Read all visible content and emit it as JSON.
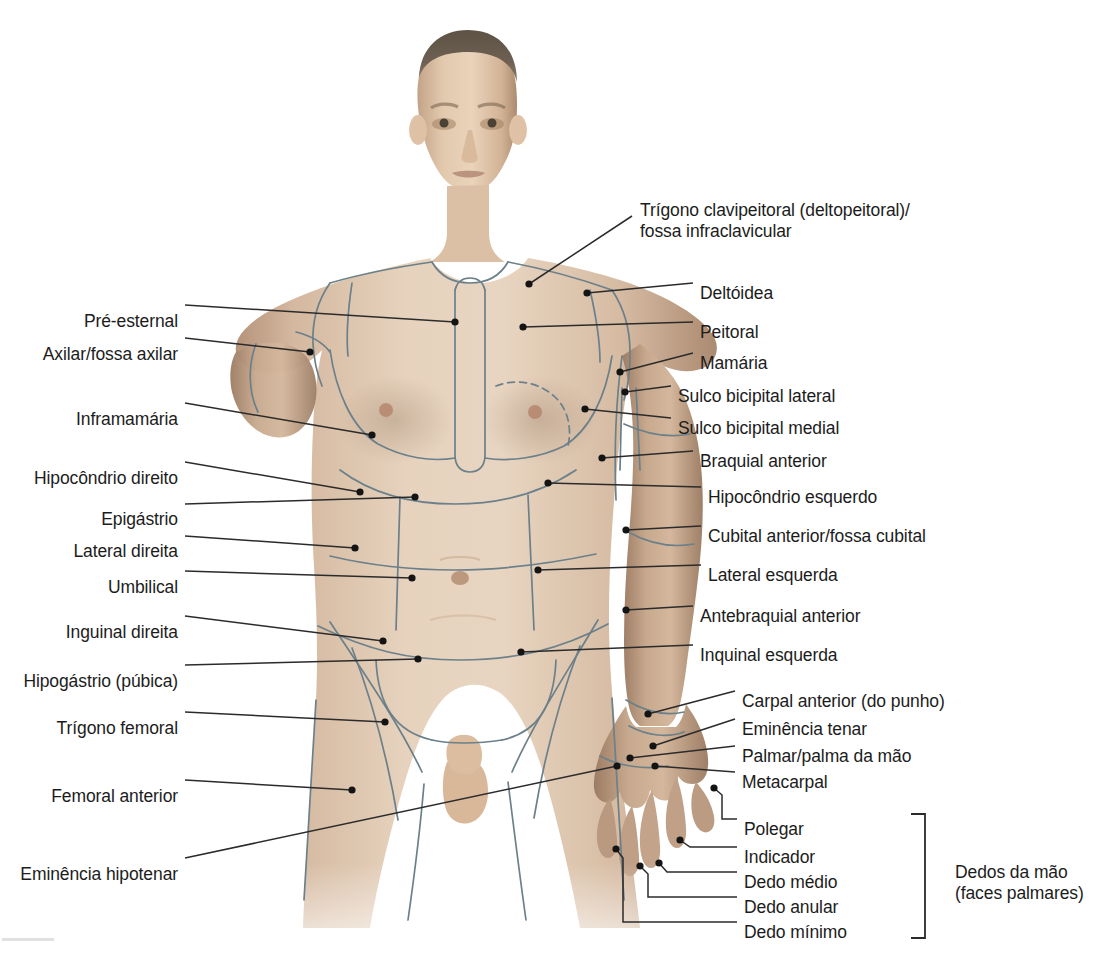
{
  "figure": {
    "width": 1109,
    "height": 958
  },
  "colors": {
    "region_line": "#6b808a",
    "leader_line": "#2b2b2b",
    "text": "#1c1c1c",
    "background": "#ffffff",
    "skin_light": "#e3cdb6",
    "skin_mid": "#cdb096",
    "skin_shadow": "#a88a6f"
  },
  "labels_left": [
    {
      "id": "pre-esternal",
      "text": "Pré-esternal",
      "x": 178,
      "y": 311
    },
    {
      "id": "axilar",
      "text": "Axilar/fossa axilar",
      "x": 178,
      "y": 344
    },
    {
      "id": "inframamaria",
      "text": "Inframamária",
      "x": 178,
      "y": 409
    },
    {
      "id": "hipocondrio-direito",
      "text": "Hipocôndrio direito",
      "x": 178,
      "y": 468
    },
    {
      "id": "epigastrio",
      "text": "Epigástrio",
      "x": 178,
      "y": 509
    },
    {
      "id": "lateral-direita",
      "text": "Lateral direita",
      "x": 178,
      "y": 541
    },
    {
      "id": "umbilical",
      "text": "Umbilical",
      "x": 178,
      "y": 577
    },
    {
      "id": "inguinal-direita",
      "text": "Inguinal direita",
      "x": 178,
      "y": 622
    },
    {
      "id": "hipogastrio",
      "text": "Hipogástrio (púbica)",
      "x": 178,
      "y": 671
    },
    {
      "id": "trigono-femoral",
      "text": "Trígono femoral",
      "x": 178,
      "y": 718
    },
    {
      "id": "femoral-anterior",
      "text": "Femoral anterior",
      "x": 178,
      "y": 786
    },
    {
      "id": "eminencia-hipotenar",
      "text": "Eminência hipotenar",
      "x": 178,
      "y": 864
    }
  ],
  "labels_right": [
    {
      "id": "trigono-clavipeitoral",
      "text": "Trígono clavipeitoral (deltopeitoral)/\nfossa infraclavicular",
      "x": 640,
      "y": 200,
      "multiline": true
    },
    {
      "id": "deltoidea",
      "text": "Deltóidea",
      "x": 700,
      "y": 283
    },
    {
      "id": "peitoral",
      "text": "Peitoral",
      "x": 700,
      "y": 322
    },
    {
      "id": "mamaria",
      "text": "Mamária",
      "x": 700,
      "y": 353
    },
    {
      "id": "sulco-bicipital-lateral",
      "text": "Sulco bicipital lateral",
      "x": 678,
      "y": 386
    },
    {
      "id": "sulco-bicipital-medial",
      "text": "Sulco bicipital medial",
      "x": 678,
      "y": 418
    },
    {
      "id": "braquial-anterior",
      "text": "Braquial anterior",
      "x": 700,
      "y": 451
    },
    {
      "id": "hipocondrio-esquerdo",
      "text": "Hipocôndrio esquerdo",
      "x": 708,
      "y": 487
    },
    {
      "id": "cubital-anterior",
      "text": "Cubital anterior/fossa cubital",
      "x": 708,
      "y": 526
    },
    {
      "id": "lateral-esquerda",
      "text": "Lateral esquerda",
      "x": 708,
      "y": 565
    },
    {
      "id": "antebraquial-anterior",
      "text": "Antebraquial anterior",
      "x": 700,
      "y": 606
    },
    {
      "id": "inquinal-esquerda",
      "text": "Inquinal esquerda",
      "x": 700,
      "y": 645
    },
    {
      "id": "carpal-anterior",
      "text": "Carpal anterior (do punho)",
      "x": 742,
      "y": 691
    },
    {
      "id": "eminencia-tenar",
      "text": "Eminência tenar",
      "x": 742,
      "y": 719
    },
    {
      "id": "palmar",
      "text": "Palmar/palma da mão",
      "x": 742,
      "y": 746
    },
    {
      "id": "metacarpal",
      "text": "Metacarpal",
      "x": 742,
      "y": 772
    }
  ],
  "labels_fingers": [
    {
      "id": "polegar",
      "text": "Polegar",
      "x": 744,
      "y": 819
    },
    {
      "id": "indicador",
      "text": "Indicador",
      "x": 744,
      "y": 847
    },
    {
      "id": "dedo-medio",
      "text": "Dedo médio",
      "x": 744,
      "y": 872
    },
    {
      "id": "dedo-anular",
      "text": "Dedo anular",
      "x": 744,
      "y": 897
    },
    {
      "id": "dedo-minimo",
      "text": "Dedo mínimo",
      "x": 744,
      "y": 922
    }
  ],
  "bracket_group": {
    "id": "dedos-da-mao",
    "text": "Dedos da mão\n(faces palmares)",
    "x": 955,
    "y": 862,
    "bracket": {
      "x": 925,
      "top": 814,
      "bottom": 938,
      "tick": 14
    }
  },
  "leader_lines_left": [
    {
      "id": "pre-esternal",
      "points": "185,305 455,322",
      "dot": [
        455,
        322
      ]
    },
    {
      "id": "axilar",
      "points": "185,338 310,352",
      "dot": [
        310,
        352
      ]
    },
    {
      "id": "inframamaria",
      "points": "185,403 372,435",
      "dot": [
        372,
        435
      ]
    },
    {
      "id": "hipocondrio-direito",
      "points": "185,462 360,492",
      "dot": [
        360,
        492
      ]
    },
    {
      "id": "epigastrio",
      "points": "185,504 415,497",
      "dot": [
        415,
        497
      ]
    },
    {
      "id": "lateral-direita",
      "points": "185,536 355,548",
      "dot": [
        355,
        548
      ]
    },
    {
      "id": "umbilical",
      "points": "185,571 412,578",
      "dot": [
        412,
        578
      ]
    },
    {
      "id": "inguinal-direita",
      "points": "185,616 383,641",
      "dot": [
        383,
        641
      ]
    },
    {
      "id": "hipogastrio",
      "points": "185,665 418,659",
      "dot": [
        418,
        659
      ]
    },
    {
      "id": "trigono-femoral",
      "points": "185,712 385,722",
      "dot": [
        385,
        722
      ]
    },
    {
      "id": "femoral-anterior",
      "points": "185,780 352,790",
      "dot": [
        352,
        790
      ]
    },
    {
      "id": "eminencia-hipotenar",
      "points": "185,858 617,766",
      "dot": [
        617,
        766
      ]
    }
  ],
  "leader_lines_right": [
    {
      "id": "trigono-clavipeitoral",
      "points": "632,216 529,284",
      "dot": [
        529,
        284
      ]
    },
    {
      "id": "deltoidea",
      "points": "693,283 587,293",
      "dot": [
        587,
        293
      ]
    },
    {
      "id": "peitoral",
      "points": "693,322 523,327",
      "dot": [
        523,
        327
      ]
    },
    {
      "id": "mamaria",
      "points": "693,353 620,372",
      "dot": [
        620,
        372
      ]
    },
    {
      "id": "sulco-bicipital-lateral",
      "points": "671,386 625,392",
      "dot": [
        625,
        392
      ]
    },
    {
      "id": "sulco-bicipital-medial",
      "points": "671,418 585,409",
      "dot": [
        585,
        409
      ]
    },
    {
      "id": "braquial-anterior",
      "points": "693,451 602,458",
      "dot": [
        602,
        458
      ]
    },
    {
      "id": "hipocondrio-esquerdo",
      "points": "701,487 548,483",
      "dot": [
        548,
        483
      ]
    },
    {
      "id": "cubital-anterior",
      "points": "701,526 626,530",
      "dot": [
        626,
        530
      ]
    },
    {
      "id": "lateral-esquerda",
      "points": "701,565 538,570",
      "dot": [
        538,
        570
      ]
    },
    {
      "id": "antebraquial-anterior",
      "points": "693,606 626,610",
      "dot": [
        626,
        610
      ]
    },
    {
      "id": "inquinal-esquerda",
      "points": "693,645 521,652",
      "dot": [
        521,
        652
      ]
    },
    {
      "id": "carpal-anterior",
      "points": "735,691 648,714",
      "dot": [
        648,
        714
      ]
    },
    {
      "id": "eminencia-tenar",
      "points": "735,719 653,746",
      "dot": [
        653,
        746
      ]
    },
    {
      "id": "palmar",
      "points": "735,746 630,758",
      "dot": [
        630,
        758
      ]
    },
    {
      "id": "metacarpal",
      "points": "735,772 655,766",
      "dot": [
        655,
        766
      ]
    }
  ],
  "leader_lines_fingers": [
    {
      "id": "polegar",
      "points": "737,819 722,819 722,795 714,788",
      "dot": [
        714,
        788
      ]
    },
    {
      "id": "indicador",
      "points": "737,847 690,847 680,840",
      "dot": [
        680,
        840
      ]
    },
    {
      "id": "dedo-medio",
      "points": "737,872 667,872 659,863",
      "dot": [
        659,
        863
      ]
    },
    {
      "id": "dedo-anular",
      "points": "737,897 648,897 648,874 640,866",
      "dot": [
        640,
        866
      ]
    },
    {
      "id": "dedo-minimo",
      "points": "737,922 623,922 623,858 616,849",
      "dot": [
        616,
        849
      ]
    }
  ]
}
